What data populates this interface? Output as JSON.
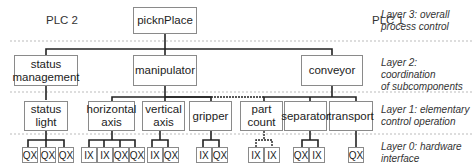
{
  "plc_labels": {
    "left": "PLC 2",
    "right": "PLC 1"
  },
  "layers": {
    "layer3": {
      "line1": "Layer 3: overall",
      "line2": "process control"
    },
    "layer2": {
      "line1": "Layer 2: coordination",
      "line2": "of subcomponents"
    },
    "layer1": {
      "line1": "Layer 1: elementary",
      "line2": "control operation"
    },
    "layer0": {
      "line1": "Layer 0: hardware",
      "line2": "interface"
    }
  },
  "nodes": {
    "root": "picknPlace",
    "level2": {
      "status_management": {
        "line1": "status",
        "line2": "management"
      },
      "manipulator": "manipulator",
      "conveyor": "conveyor"
    },
    "level1": {
      "status_light": {
        "line1": "status",
        "line2": "light"
      },
      "horizontal_axis": {
        "line1": "horizontal",
        "line2": "axis"
      },
      "vertical_axis": {
        "line1": "vertical",
        "line2": "axis"
      },
      "gripper": "gripper",
      "part_count": {
        "line1": "part",
        "line2": "count"
      },
      "separator": "separator",
      "transport": "transport"
    }
  },
  "io": {
    "status_light": [
      "QX",
      "QX",
      "QX"
    ],
    "horizontal_axis": [
      "IX",
      "IX",
      "QX",
      "QX"
    ],
    "vertical_axis": [
      "IX",
      "QX"
    ],
    "gripper": [
      "IX",
      "QX"
    ],
    "part_count": [
      "IX",
      "IX"
    ],
    "separator": [
      "QX",
      "IX"
    ],
    "transport": [
      "QX"
    ]
  },
  "colors": {
    "line": "#222222",
    "box_border": "#8a8a8a",
    "dotted": "#bbbbbb"
  }
}
